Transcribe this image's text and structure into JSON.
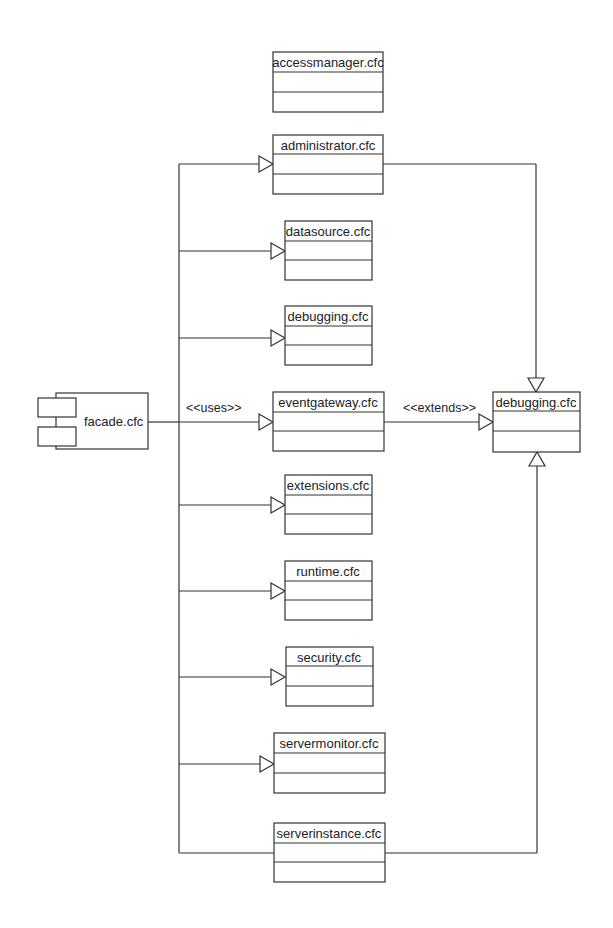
{
  "diagram": {
    "type": "UML class/component diagram",
    "component": {
      "name": "facade.cfc"
    },
    "edge_labels": {
      "uses": "<<uses>>",
      "extends": "<<extends>>"
    },
    "classes": [
      {
        "name": "accessmanager.cfc",
        "connected": false
      },
      {
        "name": "administrator.cfc",
        "connected": true,
        "extends_debugging": true
      },
      {
        "name": "datasource.cfc",
        "connected": true
      },
      {
        "name": "debugging.cfc",
        "connected": true
      },
      {
        "name": "eventgateway.cfc",
        "connected": true,
        "extends_debugging": true
      },
      {
        "name": "extensions.cfc",
        "connected": true
      },
      {
        "name": "runtime.cfc",
        "connected": true
      },
      {
        "name": "security.cfc",
        "connected": true
      },
      {
        "name": "servermonitor.cfc",
        "connected": true
      },
      {
        "name": "serverinstance.cfc",
        "connected": true,
        "extends_debugging": true
      }
    ],
    "parent_class": {
      "name": "debugging.cfc"
    },
    "colors": {
      "line": "#333333",
      "background": "#ffffff",
      "text": "#222222"
    }
  }
}
